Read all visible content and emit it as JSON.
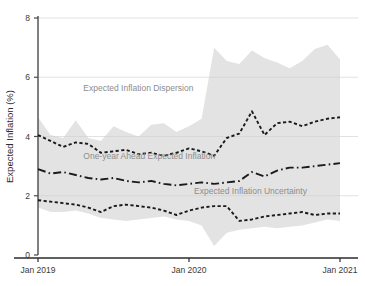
{
  "chart_data": {
    "type": "line",
    "title": "",
    "xlabel": "",
    "ylabel": "Expected Inflation (%)",
    "ylim": [
      0,
      8
    ],
    "yticks": [
      0,
      2,
      4,
      6,
      8
    ],
    "ytick_labels": [
      "0",
      "2",
      "4",
      "6",
      "8"
    ],
    "xticks": [
      "Jan 2019",
      "Jan 2020",
      "Jan 2021"
    ],
    "xtick_labels": [
      "Jan 2019",
      "Jan 2020",
      "Jan 2021"
    ],
    "xlim_months": [
      0,
      25
    ],
    "grid": "horizontal-light",
    "legend": "in-plot annotations",
    "annotations": [
      {
        "name": "dispersion-label",
        "text": "Expected Inflation Dispersion",
        "x_month": 3.6,
        "y_value": 5.55
      },
      {
        "name": "one-year-label",
        "text": "One-year Ahead Expected Inflation",
        "x_month": 3.6,
        "y_value": 3.25
      },
      {
        "name": "uncertainty-label",
        "text": "Expected Inflation Uncertainty",
        "x_month": 12.4,
        "y_value": 2.05
      }
    ],
    "x": [
      0,
      1,
      2,
      3,
      4,
      5,
      6,
      7,
      8,
      9,
      10,
      11,
      12,
      13,
      14,
      15,
      16,
      17,
      18,
      19,
      20,
      21,
      22,
      23,
      24
    ],
    "series": [
      {
        "name": "Expected Inflation Dispersion Upper",
        "style": "band-upper",
        "color": "#e3e3e3",
        "values": [
          4.65,
          4.05,
          3.95,
          4.55,
          3.95,
          3.85,
          4.35,
          4.15,
          4.0,
          4.4,
          4.45,
          4.15,
          4.35,
          4.6,
          7.0,
          6.55,
          6.45,
          6.9,
          6.65,
          6.5,
          6.3,
          6.55,
          6.95,
          7.1,
          6.6
        ]
      },
      {
        "name": "Expected Inflation Dispersion Lower",
        "style": "band-lower",
        "color": "#e3e3e3",
        "values": [
          1.6,
          1.45,
          1.45,
          1.5,
          1.4,
          1.25,
          1.2,
          1.15,
          1.2,
          1.25,
          1.3,
          1.2,
          1.15,
          1.0,
          0.3,
          0.75,
          0.85,
          0.9,
          0.95,
          0.9,
          0.95,
          1.0,
          1.1,
          1.2,
          1.15
        ]
      },
      {
        "name": "Upper Percentile Expected Inflation",
        "style": "dotted",
        "color": "#1a1a1a",
        "values": [
          4.05,
          3.85,
          3.65,
          3.8,
          3.75,
          3.45,
          3.5,
          3.55,
          3.4,
          3.45,
          3.35,
          3.45,
          3.6,
          3.5,
          3.35,
          3.95,
          4.1,
          4.85,
          4.05,
          4.45,
          4.5,
          4.35,
          4.5,
          4.6,
          4.65
        ]
      },
      {
        "name": "One-year Ahead Expected Inflation",
        "style": "dash-dot",
        "color": "#1a1a1a",
        "values": [
          2.9,
          2.75,
          2.8,
          2.7,
          2.6,
          2.55,
          2.6,
          2.5,
          2.45,
          2.5,
          2.4,
          2.35,
          2.4,
          2.45,
          2.4,
          2.45,
          2.5,
          2.8,
          2.65,
          2.85,
          2.95,
          2.95,
          3.0,
          3.05,
          3.1
        ]
      },
      {
        "name": "Expected Inflation Uncertainty",
        "style": "dotted",
        "color": "#1a1a1a",
        "values": [
          1.85,
          1.8,
          1.75,
          1.7,
          1.6,
          1.45,
          1.65,
          1.7,
          1.65,
          1.6,
          1.5,
          1.35,
          1.5,
          1.6,
          1.65,
          1.65,
          1.15,
          1.2,
          1.3,
          1.35,
          1.4,
          1.45,
          1.35,
          1.4,
          1.4
        ]
      }
    ]
  }
}
